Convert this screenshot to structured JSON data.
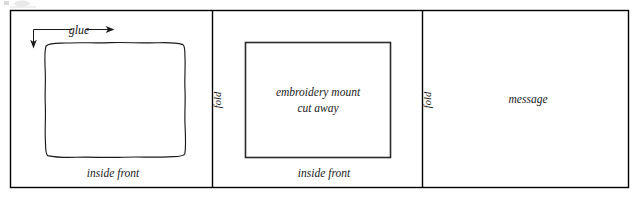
{
  "figure": {
    "background_color": "#ffffff",
    "ink_color": "#1a1a1a"
  },
  "panels": [
    {
      "id": "panel-left",
      "bottom_label": "inside front",
      "callout_label": "glue",
      "shape": "hand-drawn-rectangle",
      "shape_label": ""
    },
    {
      "id": "panel-middle",
      "fold_label": "fold",
      "bottom_label": "inside front",
      "shape": "rectangle",
      "shape_label_line1": "embroidery mount",
      "shape_label_line2": "cut away"
    },
    {
      "id": "panel-right",
      "fold_label": "fold",
      "bottom_label": "",
      "center_label": "message"
    }
  ],
  "icons": {
    "arrow_down": "down-arrow-icon",
    "arrow_right": "right-arrow-icon"
  }
}
